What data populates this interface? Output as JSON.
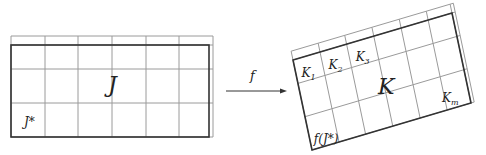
{
  "diagram": {
    "source": {
      "name": "J",
      "sub_label": "J*",
      "frame": {
        "x0": 11,
        "y0": 45,
        "x1": 209,
        "y1": 137
      },
      "grid_cols_x": [
        11,
        45,
        78,
        112,
        146,
        179,
        213
      ],
      "grid_rows_y": [
        36,
        45,
        69,
        103,
        137
      ],
      "label_pos": {
        "x": 108,
        "y": 92
      },
      "sub_label_pos": {
        "x": 24,
        "y": 126
      }
    },
    "arrow": {
      "label": "f",
      "x1": 226,
      "y1": 91,
      "x2": 287,
      "y2": 91,
      "label_pos": {
        "x": 250,
        "y": 80
      }
    },
    "target": {
      "name": "K",
      "origin": [
        293,
        60
      ],
      "u": [
        159,
        -47
      ],
      "v": [
        19,
        90
      ],
      "col_s": [
        0,
        0.17,
        0.337,
        0.508,
        0.68,
        0.85,
        1.0,
        1.02
      ],
      "row_t": [
        -0.098,
        0,
        0.26,
        0.63,
        1.0
      ],
      "labels": [
        {
          "text": "K",
          "sub": "1",
          "s": 0.03,
          "t": 0.2,
          "size": 12
        },
        {
          "text": "K",
          "sub": "2",
          "s": 0.2,
          "t": 0.2,
          "size": 12
        },
        {
          "text": "K",
          "sub": "3",
          "s": 0.37,
          "t": 0.2,
          "size": 12
        },
        {
          "text": "K",
          "sub": "",
          "s": 0.46,
          "t": 0.62,
          "size": 22
        },
        {
          "text": "K",
          "sub": "m",
          "s": 0.83,
          "t": 0.9,
          "size": 12
        },
        {
          "text": "f(J*)",
          "sub": "",
          "s": 0.02,
          "t": 0.93,
          "size": 12
        }
      ]
    },
    "colors": {
      "thick": "#333333",
      "thin": "#8a8a8a",
      "grid": "#9a9a9a"
    }
  }
}
